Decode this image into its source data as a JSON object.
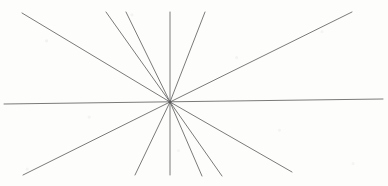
{
  "figure": {
    "type": "line-drawing",
    "width": 388,
    "height": 186,
    "background_color": "#fdfdfc",
    "stroke_color": "#6b6b6b",
    "stroke_width": 0.9,
    "center": {
      "x": 170,
      "y": 102
    },
    "line_count": 11
  },
  "chart_data": {
    "type": "line",
    "xlabel": "",
    "ylabel": "",
    "xlim": [
      0,
      388
    ],
    "ylim": [
      0,
      186
    ],
    "grid": false,
    "legend": "none",
    "annotations": [],
    "center": {
      "x": 170,
      "y": 102
    },
    "series": [
      {
        "name": "ray-horizontal",
        "x": [
          4,
          383
        ],
        "y": [
          104,
          99
        ]
      },
      {
        "name": "ray-upper-left-shallow",
        "x": [
          22,
          170
        ],
        "y": [
          13,
          102
        ]
      },
      {
        "name": "ray-lower-right-shallow",
        "x": [
          170,
          292
        ],
        "y": [
          102,
          172
        ]
      },
      {
        "name": "ray-upper-left-steep-a",
        "x": [
          106,
          170
        ],
        "y": [
          12,
          102
        ]
      },
      {
        "name": "ray-lower-right-steep-a",
        "x": [
          170,
          222
        ],
        "y": [
          102,
          176
        ]
      },
      {
        "name": "ray-upper-left-steep-b",
        "x": [
          126,
          170
        ],
        "y": [
          12,
          102
        ]
      },
      {
        "name": "ray-lower-right-steep-b",
        "x": [
          170,
          202
        ],
        "y": [
          102,
          176
        ]
      },
      {
        "name": "ray-vertical",
        "x": [
          170,
          170
        ],
        "y": [
          12,
          175
        ]
      },
      {
        "name": "ray-upper-right-steep",
        "x": [
          205,
          170
        ],
        "y": [
          12,
          102
        ]
      },
      {
        "name": "ray-lower-left-steep",
        "x": [
          170,
          135
        ],
        "y": [
          102,
          175
        ]
      },
      {
        "name": "ray-upper-right-shallow",
        "x": [
          352,
          170
        ],
        "y": [
          12,
          102
        ]
      },
      {
        "name": "ray-lower-left-shallow",
        "x": [
          170,
          23
        ],
        "y": [
          102,
          175
        ]
      }
    ]
  }
}
